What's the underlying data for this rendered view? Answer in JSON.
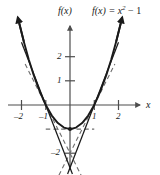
{
  "figure": {
    "y_axis_caption": "f(x)",
    "equation_caption_prefix": "f(x) = x",
    "equation_caption_exponent": "2",
    "equation_caption_suffix": " − 1",
    "x_axis_name": "x"
  },
  "ticks": {
    "x": [
      {
        "label": "–2",
        "value": -2
      },
      {
        "label": "–1",
        "value": -1
      },
      {
        "label": "1",
        "value": 1
      },
      {
        "label": "2",
        "value": 2
      }
    ],
    "y": [
      {
        "label": "2",
        "value": 2
      },
      {
        "label": "1",
        "value": 1
      },
      {
        "label": "–2",
        "value": -2
      }
    ]
  },
  "chart_data": {
    "type": "line",
    "xlabel": "x",
    "ylabel": "f(x)",
    "xlim": [
      -2.2,
      2.2
    ],
    "ylim": [
      -2.6,
      3.6
    ],
    "grid": false,
    "legend": "none",
    "xticks": [
      -2,
      -1,
      1,
      2
    ],
    "xticklabels": [
      "–2",
      "–1",
      "1",
      "2"
    ],
    "yticks": [
      2,
      1,
      -2
    ],
    "yticklabels": [
      "2",
      "1",
      "–2"
    ],
    "series": [
      {
        "name": "f(x) = x^2 - 1",
        "style": "solid",
        "formula": "x^2 - 1",
        "x": [
          -2.15,
          -1.9,
          -1.7,
          -1.5,
          -1.25,
          -1.0,
          -0.75,
          -0.5,
          -0.25,
          0,
          0.25,
          0.5,
          0.75,
          1.0,
          1.25,
          1.5,
          1.7,
          1.9,
          2.15
        ],
        "y": [
          3.62,
          2.61,
          1.89,
          1.25,
          0.5625,
          0,
          -0.4375,
          -0.75,
          -0.9375,
          -1,
          -0.9375,
          -0.75,
          -0.4375,
          0,
          0.5625,
          1.25,
          1.89,
          2.61,
          3.62
        ],
        "arrows": "both-ends"
      },
      {
        "name": "secant through (-1,0)",
        "style": "solid",
        "formula": "y = -2.6(x + 1)",
        "x": [
          -2.0,
          0.1
        ],
        "y": [
          2.6,
          -2.86
        ]
      },
      {
        "name": "secant through (1,0)",
        "style": "solid",
        "formula": "y = 2.6(x - 1)",
        "x": [
          -0.1,
          2.0
        ],
        "y": [
          -2.86,
          2.6
        ]
      },
      {
        "name": "tangent at (-1,0)",
        "style": "dashed",
        "formula": "y = -2(x + 1)",
        "x": [
          -1.85,
          0.6
        ],
        "y": [
          1.7,
          -3.2
        ]
      },
      {
        "name": "tangent at (1,0)",
        "style": "dashed",
        "formula": "y = 2(x - 1)",
        "x": [
          -0.6,
          1.85
        ],
        "y": [
          -3.2,
          1.7
        ]
      },
      {
        "name": "tangent at vertex (0,-1)",
        "style": "dashed",
        "formula": "y = -1",
        "x": [
          -1.0,
          1.0
        ],
        "y": [
          -1,
          -1
        ]
      }
    ],
    "points": [
      {
        "label": "",
        "x": 0,
        "y": -1,
        "marker": "dot"
      }
    ],
    "annotations": [
      {
        "text": "f(x)",
        "x": 0,
        "y": 3.4,
        "role": "y-axis-caption"
      },
      {
        "text": "f(x) = x² − 1",
        "x": 1.4,
        "y": 3.4,
        "role": "curve-equation"
      },
      {
        "text": "x",
        "x": 2.3,
        "y": 0,
        "role": "x-axis-caption"
      }
    ]
  },
  "style": {
    "curve_color": "#1a1a1a",
    "axis_color": "#4d4d4d",
    "dashed_color": "#6e6e6e",
    "background": "#ffffff"
  }
}
